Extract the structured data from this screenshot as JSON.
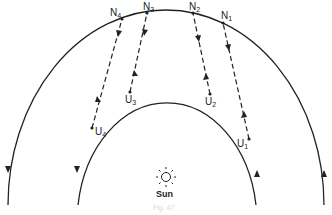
{
  "diagram": {
    "type": "orbital-diagram",
    "outer_orbit": {
      "label": "",
      "direction": "arrows down on left, up on right"
    },
    "inner_orbit": {
      "label": "",
      "direction": "arrows down on left, up on right"
    },
    "outer_points": [
      {
        "id": "N1",
        "base": "N",
        "sub": "1"
      },
      {
        "id": "N2",
        "base": "N",
        "sub": "2"
      },
      {
        "id": "N3",
        "base": "N",
        "sub": "3"
      },
      {
        "id": "N4",
        "base": "N",
        "sub": "4"
      }
    ],
    "inner_points": [
      {
        "id": "U1",
        "base": "U",
        "sub": "1"
      },
      {
        "id": "U2",
        "base": "U",
        "sub": "2"
      },
      {
        "id": "U3",
        "base": "U",
        "sub": "3"
      },
      {
        "id": "U4",
        "base": "U",
        "sub": "4"
      }
    ],
    "connections": [
      {
        "from": "U1",
        "to": "N1"
      },
      {
        "from": "U2",
        "to": "N2"
      },
      {
        "from": "U3",
        "to": "N3"
      },
      {
        "from": "U4",
        "to": "N4"
      }
    ],
    "sun_label": "Sun",
    "caption": "Fig. 47"
  }
}
